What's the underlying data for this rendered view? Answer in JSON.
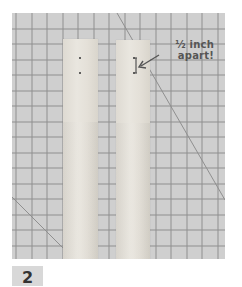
{
  "photo": {
    "subject": "two wooden craft sticks on a gridded cutting mat",
    "colors": {
      "mat": "#cfcfcf",
      "grid_line": "#8a8a8a",
      "stick": "#e6e2da",
      "hole": "#333333",
      "annotation": "#555555"
    }
  },
  "annotation": {
    "line1": "½ inch",
    "line2": "apart!"
  },
  "step": {
    "number": "2"
  }
}
